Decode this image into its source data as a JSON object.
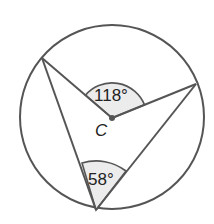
{
  "diagram": {
    "center_label": "C",
    "central_angle_label": "118°",
    "inscribed_angle_label": "58°",
    "colors": {
      "stroke": "#555555",
      "shade": "#ececec",
      "text": "#222222"
    }
  }
}
